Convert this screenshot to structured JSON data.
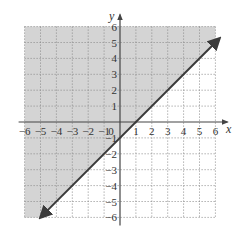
{
  "chart_data": {
    "type": "line",
    "title": "",
    "inequality": "y >= x - 1",
    "boundary_line": {
      "equation": "y = x - 1",
      "slope": 1,
      "intercept": -1,
      "style": "solid",
      "arrows": "both"
    },
    "shaded_region": "above line",
    "series": [
      {
        "name": "y = x - 1",
        "x": [
          -5,
          -4,
          -3,
          -2,
          -1,
          0,
          1,
          2,
          3,
          4,
          5,
          6
        ],
        "values": [
          -6,
          -5,
          -4,
          -3,
          -2,
          -1,
          0,
          1,
          2,
          3,
          4,
          5
        ]
      }
    ],
    "xlabel": "x",
    "ylabel": "y",
    "xlim": [
      -6,
      6
    ],
    "ylim": [
      -6,
      6
    ],
    "x_ticks": [
      "-6",
      "-5",
      "-4",
      "-3",
      "-2",
      "-1",
      "0",
      "1",
      "2",
      "3",
      "4",
      "5",
      "6"
    ],
    "y_ticks": [
      "-6",
      "-5",
      "-4",
      "-3",
      "-2",
      "-1",
      "1",
      "2",
      "3",
      "4",
      "5",
      "6"
    ],
    "grid": true,
    "grid_style": "dotted",
    "legend": null
  },
  "axes": {
    "x_label": "x",
    "y_label": "y",
    "origin_label": "0"
  },
  "colors": {
    "shade": "#d4d4d4",
    "line": "#3a3a3a",
    "axis": "#444444",
    "grid": "#8a8a8a"
  }
}
